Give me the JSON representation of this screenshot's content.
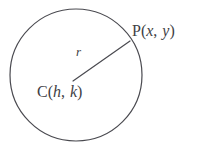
{
  "figure": {
    "type": "geometry-diagram",
    "background_color": "#ffffff",
    "stroke_color": "#4a4a50",
    "text_color": "#3f3f45",
    "circle": {
      "center_x": 76,
      "center_y": 75,
      "radius": 66,
      "stroke_width": 1.2
    },
    "radius_segment": {
      "from_x": 73,
      "from_y": 81,
      "to_x": 130,
      "to_y": 41,
      "stroke_width": 1.2
    },
    "labels": {
      "point": {
        "full_text": "P(x, y)",
        "name": "P",
        "open_paren": "(",
        "var_x": "x",
        "separator": ", ",
        "var_y": "y",
        "close_paren": ")"
      },
      "center": {
        "full_text": "C(h, k)",
        "name": "C",
        "open_paren": "(",
        "var_h": "h",
        "separator": ", ",
        "var_k": "k",
        "close_paren": ")"
      },
      "radius": {
        "full_text": "r",
        "symbol": "r"
      }
    }
  }
}
